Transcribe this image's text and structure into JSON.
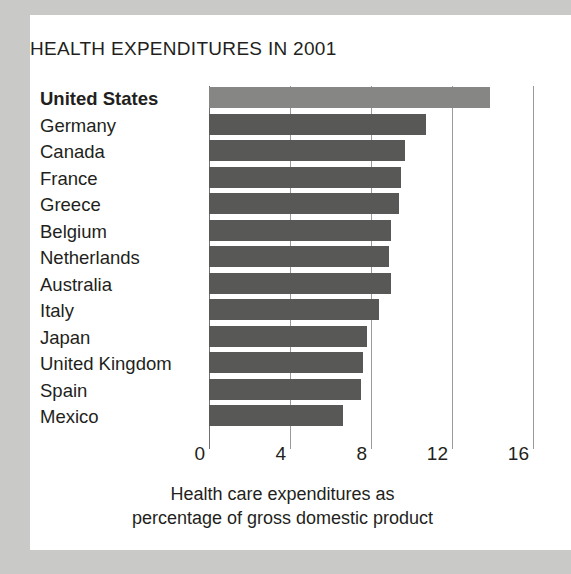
{
  "figure": {
    "title": "HEALTH EXPENDITURES IN 2001",
    "caption_line1": "Health care expenditures as",
    "caption_line2": "percentage of gross domestic product"
  },
  "colors": {
    "bar": "#585856",
    "bar_highlight": "#868684",
    "panel_background": "#ffffff",
    "outer_background": "#c9c9c7",
    "text": "#231f20",
    "gridline": "#9a9a9a"
  },
  "chart_data": {
    "type": "bar",
    "orientation": "horizontal",
    "title": "HEALTH EXPENDITURES IN 2001",
    "xlabel": "Health care expenditures as percentage of gross domestic product",
    "ylabel": "",
    "xlim": [
      0,
      17
    ],
    "xticks": [
      0,
      4,
      8,
      12,
      16
    ],
    "grid": true,
    "legend": "none",
    "highlight_category": "United States",
    "categories": [
      "United States",
      "Germany",
      "Canada",
      "France",
      "Greece",
      "Belgium",
      "Netherlands",
      "Australia",
      "Italy",
      "Japan",
      "United Kingdom",
      "Spain",
      "Mexico"
    ],
    "values": [
      13.9,
      10.7,
      9.7,
      9.5,
      9.4,
      9.0,
      8.9,
      9.0,
      8.4,
      7.8,
      7.6,
      7.5,
      6.6
    ],
    "units": "percent of GDP",
    "bars": [
      {
        "category": "United States",
        "value": 13.9,
        "highlight": true
      },
      {
        "category": "Germany",
        "value": 10.7,
        "highlight": false
      },
      {
        "category": "Canada",
        "value": 9.7,
        "highlight": false
      },
      {
        "category": "France",
        "value": 9.5,
        "highlight": false
      },
      {
        "category": "Greece",
        "value": 9.4,
        "highlight": false
      },
      {
        "category": "Belgium",
        "value": 9.0,
        "highlight": false
      },
      {
        "category": "Netherlands",
        "value": 8.9,
        "highlight": false
      },
      {
        "category": "Australia",
        "value": 9.0,
        "highlight": false
      },
      {
        "category": "Italy",
        "value": 8.4,
        "highlight": false
      },
      {
        "category": "Japan",
        "value": 7.8,
        "highlight": false
      },
      {
        "category": "United Kingdom",
        "value": 7.6,
        "highlight": false
      },
      {
        "category": "Spain",
        "value": 7.5,
        "highlight": false
      },
      {
        "category": "Mexico",
        "value": 6.6,
        "highlight": false
      }
    ]
  }
}
